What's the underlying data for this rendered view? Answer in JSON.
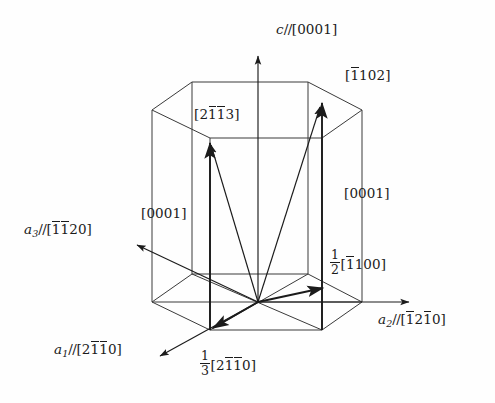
{
  "figure": {
    "type": "crystallography-unit-cell-diagram",
    "background_color": "#fefefe",
    "line_color": "#1b1b1b",
    "text_color": "#1b1b1b"
  },
  "labels": {
    "c_axis": {
      "symbol": "c",
      "sep": "//",
      "bracket_open": "[",
      "digits": "0001",
      "bracket_close": "]",
      "overbars": []
    },
    "a1_axis": {
      "symbol": "a",
      "subscript": "1",
      "sep": "//",
      "bracket_open": "[",
      "digits": "2110",
      "bracket_close": "]",
      "overbars": [
        1,
        2
      ]
    },
    "a2_axis": {
      "symbol": "a",
      "subscript": "2",
      "sep": "//",
      "bracket_open": "[",
      "digits": "1210",
      "bracket_close": "]",
      "overbars": [
        0,
        2
      ]
    },
    "a3_axis": {
      "symbol": "a",
      "subscript": "3",
      "sep": "//",
      "bracket_open": "[",
      "digits": "1120",
      "bracket_close": "]",
      "overbars": [
        0,
        1
      ]
    },
    "vector_2113": {
      "bracket_open": "[",
      "digits": "2113",
      "bracket_close": "]",
      "overbars": [
        1,
        2
      ]
    },
    "vector_1102": {
      "bracket_open": "[",
      "digits": "1102",
      "bracket_close": "]",
      "overbars": [
        0
      ]
    },
    "vector_0001_left": {
      "bracket_open": "[",
      "digits": "0001",
      "bracket_close": "]",
      "overbars": []
    },
    "vector_0001_right": {
      "bracket_open": "[",
      "digits": "0001",
      "bracket_close": "]",
      "overbars": []
    },
    "vector_half_1100": {
      "frac_num": "1",
      "frac_den": "2",
      "bracket_open": "[",
      "digits": "1100",
      "bracket_close": "]",
      "overbars": [
        0
      ]
    },
    "vector_third_2110": {
      "frac_num": "1",
      "frac_den": "3",
      "bracket_open": "[",
      "digits": "2110",
      "bracket_close": "]",
      "overbars": [
        1,
        2
      ]
    }
  },
  "geometry": {
    "origin": {
      "x": 258,
      "y": 302
    },
    "bottom_hexagon": [
      {
        "x": 152,
        "y": 302
      },
      {
        "x": 192,
        "y": 274
      },
      {
        "x": 308,
        "y": 274
      },
      {
        "x": 362,
        "y": 302
      },
      {
        "x": 322,
        "y": 330
      },
      {
        "x": 210,
        "y": 330
      }
    ],
    "top_hexagon": [
      {
        "x": 152,
        "y": 110
      },
      {
        "x": 192,
        "y": 82
      },
      {
        "x": 308,
        "y": 82
      },
      {
        "x": 362,
        "y": 110
      },
      {
        "x": 322,
        "y": 138
      },
      {
        "x": 210,
        "y": 138
      }
    ],
    "c_axis_arrow": {
      "x1": 258,
      "y1": 302,
      "x2": 258,
      "y2": 54
    },
    "a2_axis_arrow": {
      "x1": 258,
      "y1": 302,
      "x2": 412,
      "y2": 302
    },
    "a1_axis_arrow": {
      "x1": 258,
      "y1": 302,
      "x2": 158,
      "y2": 358
    },
    "a3_axis_arrow": {
      "x1": 258,
      "y1": 302,
      "x2": 135,
      "y2": 243
    },
    "burgers_vectors": [
      {
        "name": "third-2110",
        "x1": 258,
        "y1": 302,
        "x2": 210,
        "y2": 330
      },
      {
        "name": "half-1100",
        "x1": 258,
        "y1": 302,
        "x2": 326,
        "y2": 287
      },
      {
        "name": "0001-left",
        "x1": 210,
        "y1": 330,
        "x2": 210,
        "y2": 140
      },
      {
        "name": "0001-right",
        "x1": 322,
        "y1": 330,
        "x2": 322,
        "y2": 100
      },
      {
        "name": "2113",
        "x1": 258,
        "y1": 302,
        "x2": 210,
        "y2": 140
      },
      {
        "name": "1102",
        "x1": 258,
        "y1": 302,
        "x2": 322,
        "y2": 100
      }
    ]
  }
}
